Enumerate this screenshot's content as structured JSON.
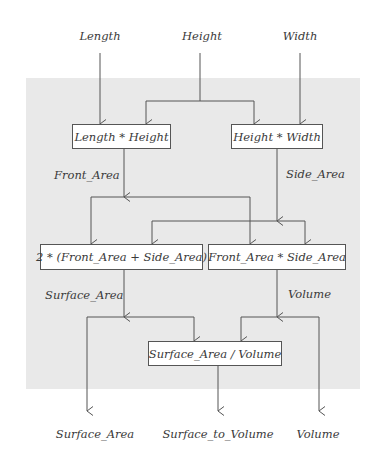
{
  "diagram": {
    "inputs": [
      {
        "id": "length",
        "label": "Length"
      },
      {
        "id": "height",
        "label": "Height"
      },
      {
        "id": "width",
        "label": "Width"
      }
    ],
    "nodes": [
      {
        "id": "front",
        "label": "Length * Height"
      },
      {
        "id": "side",
        "label": "Height * Width"
      },
      {
        "id": "surface",
        "label": "2 * (Front_Area + Side_Area)"
      },
      {
        "id": "volume",
        "label": "Front_Area * Side_Area"
      },
      {
        "id": "ratio",
        "label": "Surface_Area / Volume"
      }
    ],
    "edge_labels": {
      "front_area": "Front_Area",
      "side_area": "Side_Area",
      "surface_area": "Surface_Area",
      "volume": "Volume"
    },
    "outputs": [
      {
        "id": "out_surface",
        "label": "Surface_Area"
      },
      {
        "id": "out_ratio",
        "label": "Surface_to_Volume"
      },
      {
        "id": "out_volume",
        "label": "Volume"
      }
    ],
    "colors": {
      "panel": "#e9e9e9",
      "line": "#555555",
      "text": "#3a3a3a"
    }
  }
}
